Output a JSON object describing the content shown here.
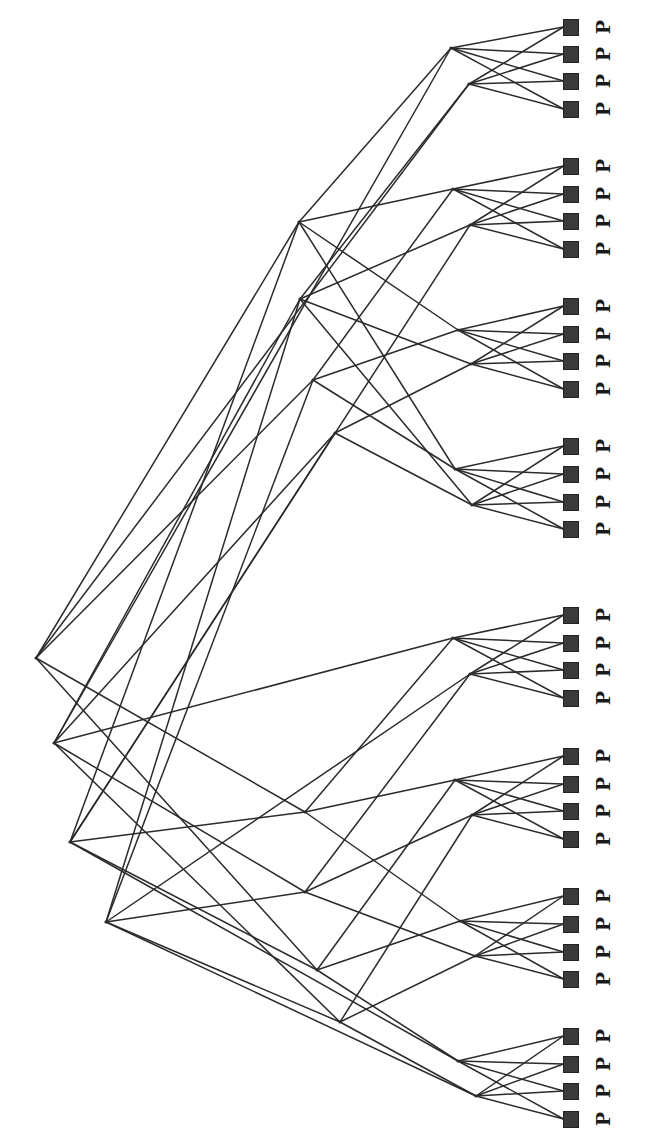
{
  "diagram": {
    "type": "fat-tree network topology",
    "orientation": "rotated 90deg (root on left, processors on right)",
    "label_char": "P",
    "colors": {
      "line": "#2b2b2b",
      "node_fill": "#3a3a3a",
      "label": "#1a1a1a",
      "background": "#ffffff"
    },
    "core_nodes": [
      {
        "id": "C1",
        "x": 36,
        "y": 658
      },
      {
        "id": "C2",
        "x": 54,
        "y": 743
      },
      {
        "id": "C3",
        "x": 70,
        "y": 842
      },
      {
        "id": "C4",
        "x": 106,
        "y": 922
      }
    ],
    "spine_nodes": [
      {
        "id": "S1",
        "x": 299,
        "y": 222
      },
      {
        "id": "S2",
        "x": 300,
        "y": 299
      },
      {
        "id": "S3",
        "x": 313,
        "y": 380
      },
      {
        "id": "S4",
        "x": 335,
        "y": 433
      },
      {
        "id": "S5",
        "x": 305,
        "y": 812
      },
      {
        "id": "S6",
        "x": 305,
        "y": 892
      },
      {
        "id": "S7",
        "x": 317,
        "y": 970
      },
      {
        "id": "S8",
        "x": 340,
        "y": 1022
      }
    ],
    "groups": [
      {
        "leaves": [
          {
            "x": 451,
            "y": 48
          },
          {
            "x": 469,
            "y": 84
          }
        ],
        "p_y": [
          27,
          54,
          81,
          109
        ]
      },
      {
        "leaves": [
          {
            "x": 453,
            "y": 189
          },
          {
            "x": 470,
            "y": 225
          }
        ],
        "p_y": [
          166,
          194,
          221,
          249
        ]
      },
      {
        "leaves": [
          {
            "x": 458,
            "y": 330
          },
          {
            "x": 471,
            "y": 364
          }
        ],
        "p_y": [
          306,
          334,
          361,
          389
        ]
      },
      {
        "leaves": [
          {
            "x": 455,
            "y": 469
          },
          {
            "x": 472,
            "y": 505
          }
        ],
        "p_y": [
          446,
          474,
          502,
          529
        ]
      },
      {
        "leaves": [
          {
            "x": 453,
            "y": 638
          },
          {
            "x": 470,
            "y": 674
          }
        ],
        "p_y": [
          615,
          643,
          670,
          698
        ]
      },
      {
        "leaves": [
          {
            "x": 455,
            "y": 780
          },
          {
            "x": 472,
            "y": 815
          }
        ],
        "p_y": [
          756,
          784,
          811,
          839
        ]
      },
      {
        "leaves": [
          {
            "x": 460,
            "y": 921
          },
          {
            "x": 475,
            "y": 956
          }
        ],
        "p_y": [
          896,
          924,
          952,
          979
        ]
      },
      {
        "leaves": [
          {
            "x": 458,
            "y": 1061
          },
          {
            "x": 476,
            "y": 1096
          }
        ],
        "p_y": [
          1036,
          1064,
          1091,
          1119
        ]
      }
    ],
    "p_square": {
      "x": 571,
      "size": 15
    },
    "p_label_x": 603,
    "leaf_spine_links": [
      [
        0,
        0,
        0,
        "S1"
      ],
      [
        0,
        0,
        1,
        "C2"
      ],
      [
        0,
        1,
        0,
        "S2"
      ],
      [
        0,
        1,
        1,
        "C1"
      ],
      [
        1,
        0,
        0,
        "S1"
      ],
      [
        1,
        0,
        1,
        "S3"
      ],
      [
        1,
        1,
        0,
        "S2"
      ],
      [
        1,
        1,
        1,
        "C3"
      ],
      [
        2,
        0,
        0,
        "S1"
      ],
      [
        2,
        0,
        1,
        "S3"
      ],
      [
        2,
        1,
        0,
        "S2"
      ],
      [
        2,
        1,
        1,
        "S4"
      ],
      [
        3,
        0,
        0,
        "S1"
      ],
      [
        3,
        0,
        1,
        "S3"
      ],
      [
        3,
        1,
        0,
        "S2"
      ],
      [
        3,
        1,
        1,
        "S4"
      ],
      [
        4,
        0,
        0,
        "S5"
      ],
      [
        4,
        0,
        1,
        "C2"
      ],
      [
        4,
        1,
        0,
        "S6"
      ],
      [
        4,
        1,
        1,
        "C4"
      ],
      [
        5,
        0,
        0,
        "S5"
      ],
      [
        5,
        0,
        1,
        "S7"
      ],
      [
        5,
        1,
        0,
        "S6"
      ],
      [
        5,
        1,
        1,
        "S8"
      ],
      [
        6,
        0,
        0,
        "S5"
      ],
      [
        6,
        0,
        1,
        "S7"
      ],
      [
        6,
        1,
        0,
        "S6"
      ],
      [
        6,
        1,
        1,
        "S8"
      ],
      [
        7,
        0,
        0,
        "S7"
      ],
      [
        7,
        0,
        1,
        "C3"
      ],
      [
        7,
        1,
        0,
        "S8"
      ],
      [
        7,
        1,
        1,
        "C4"
      ]
    ],
    "core_spine_links": [
      [
        "C1",
        "S1"
      ],
      [
        "C1",
        "S3"
      ],
      [
        "C1",
        "S5"
      ],
      [
        "C1",
        "S7"
      ],
      [
        "C2",
        "S2"
      ],
      [
        "C2",
        "S4"
      ],
      [
        "C2",
        "S6"
      ],
      [
        "C2",
        "S8"
      ],
      [
        "C3",
        "S1"
      ],
      [
        "C3",
        "S4"
      ],
      [
        "C3",
        "S5"
      ],
      [
        "C3",
        "S7"
      ],
      [
        "C4",
        "S2"
      ],
      [
        "C4",
        "S3"
      ],
      [
        "C4",
        "S6"
      ],
      [
        "C4",
        "S8"
      ]
    ]
  }
}
